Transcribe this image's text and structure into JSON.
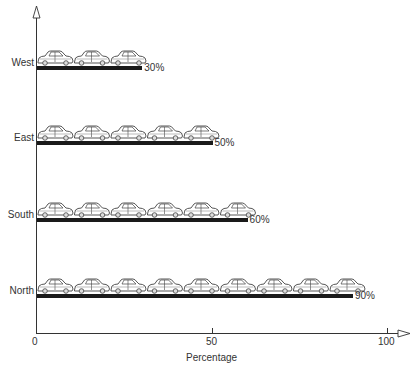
{
  "chart_data": {
    "type": "bar",
    "orientation": "horizontal",
    "style": "pictograph (car icons above each bar)",
    "categories": [
      "West",
      "East",
      "South",
      "North"
    ],
    "values": [
      30,
      50,
      60,
      90
    ],
    "value_labels": [
      "30%",
      "50%",
      "60%",
      "90%"
    ],
    "icons_per_bar": [
      3,
      5,
      6,
      9
    ],
    "icon": "car-icon",
    "title": "",
    "xlabel": "Percentage",
    "ylabel": "",
    "xlim": [
      0,
      100
    ],
    "x_ticks": [
      "0",
      "50",
      "100"
    ],
    "grid": false,
    "legend": null
  },
  "colors": {
    "bar": "#1a1a1a",
    "axis": "#333333",
    "icon_stroke": "#444444"
  }
}
